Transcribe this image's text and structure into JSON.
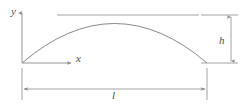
{
  "figure": {
    "kind": "parabolic-arch-diagram",
    "labels": {
      "y_axis": "y",
      "x_axis": "x",
      "height": "h",
      "span": "l"
    },
    "colors": {
      "line": "#8a8a8a",
      "curve": "#7a7a7a",
      "text": "#4d4d4d",
      "background": "#ffffff"
    },
    "geometry": {
      "origin": [
        22,
        63
      ],
      "right_support": [
        207,
        63
      ],
      "apex": [
        120,
        16
      ],
      "span_px": 185,
      "rise_px": 47,
      "y_axis_top": [
        22,
        12
      ],
      "x_axis_end": [
        72,
        63
      ],
      "top_chord_y": 15,
      "dim_line_l_y": 89,
      "dim_line_h_x": 231
    }
  }
}
